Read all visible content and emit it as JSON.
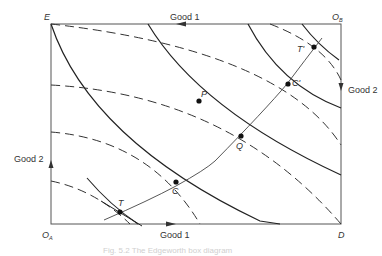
{
  "diagram": {
    "type": "edgeworth-box",
    "corners": {
      "top_left": "E",
      "top_right": "O",
      "top_right_sub": "B",
      "bottom_left": "O",
      "bottom_left_sub": "A",
      "bottom_right": "D"
    },
    "axes": {
      "top": "Good 1",
      "bottom": "Good 1",
      "left": "Good 2",
      "right": "Good 2"
    },
    "points": {
      "P": "P",
      "Q": "Q",
      "C": "C",
      "C_prime": "C'",
      "T": "T",
      "T_prime": "T'"
    },
    "caption": "Fig. 5.2  The Edgeworth box diagram",
    "colors": {
      "line": "#222222",
      "frame": "#555555",
      "caption": "#cfcfcf"
    }
  }
}
